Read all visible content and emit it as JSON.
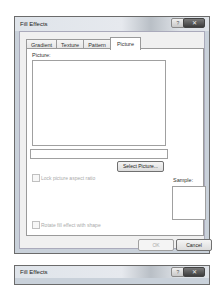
{
  "dialog": {
    "title": "Fill Effects",
    "help_glyph": "?",
    "close_glyph": "✕",
    "tabs": [
      {
        "label": "Gradient",
        "active": false
      },
      {
        "label": "Texture",
        "active": false
      },
      {
        "label": "Pattern",
        "active": false
      },
      {
        "label": "Picture",
        "active": true
      }
    ],
    "picture_label": "Picture:",
    "picture_path_value": "",
    "select_picture_label": "Select Picture...",
    "lock_aspect_label": "Lock picture aspect ratio",
    "lock_aspect_checked": false,
    "sample_label": "Sample:",
    "rotate_label": "Rotate fill effect with shape",
    "rotate_checked": false,
    "ok_label": "OK",
    "cancel_label": "Cancel"
  },
  "dialog2": {
    "title": "Fill Effects",
    "help_glyph": "?",
    "close_glyph": "✕"
  }
}
